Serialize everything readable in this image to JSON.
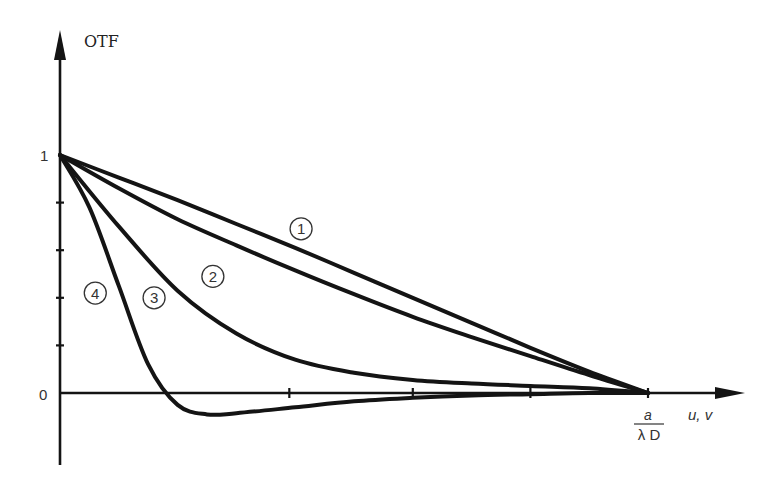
{
  "chart_data": {
    "type": "line",
    "title": "",
    "ylabel": "OTF",
    "xlabel": "u, v",
    "x_end_label": {
      "numerator": "a",
      "denominator": "λ D"
    },
    "xlim": [
      0,
      1.15
    ],
    "ylim": [
      -0.3,
      1.55
    ],
    "ytick_labels": [
      {
        "value": 1,
        "label": "1"
      },
      {
        "value": 0,
        "label": "0"
      }
    ],
    "yticks_minor": [
      0.2,
      0.4,
      0.6,
      0.8
    ],
    "xticks": [
      0.39,
      0.6,
      0.8,
      1.0
    ],
    "x_unit": "a/(λD)",
    "grid": false,
    "legend": "inline circled numbers",
    "series": [
      {
        "name": "1",
        "label": "①",
        "x": [
          0,
          0.1,
          0.2,
          0.3,
          0.4,
          0.5,
          0.6,
          0.7,
          0.8,
          0.9,
          1.0
        ],
        "y": [
          1,
          0.905,
          0.81,
          0.71,
          0.61,
          0.505,
          0.4,
          0.295,
          0.19,
          0.09,
          0
        ]
      },
      {
        "name": "2",
        "label": "②",
        "x": [
          0,
          0.1,
          0.2,
          0.3,
          0.4,
          0.5,
          0.6,
          0.7,
          0.8,
          0.9,
          1.0
        ],
        "y": [
          1,
          0.86,
          0.73,
          0.62,
          0.515,
          0.415,
          0.32,
          0.235,
          0.155,
          0.075,
          0
        ]
      },
      {
        "name": "3",
        "label": "③",
        "x": [
          0,
          0.1,
          0.2,
          0.3,
          0.4,
          0.5,
          0.6,
          0.7,
          0.8,
          0.9,
          1.0
        ],
        "y": [
          1,
          0.7,
          0.43,
          0.25,
          0.14,
          0.085,
          0.055,
          0.04,
          0.03,
          0.02,
          0
        ]
      },
      {
        "name": "4",
        "label": "④",
        "x": [
          0,
          0.05,
          0.1,
          0.15,
          0.2,
          0.25,
          0.3,
          0.4,
          0.5,
          0.6,
          0.7,
          0.8,
          0.9,
          1.0
        ],
        "y": [
          1,
          0.78,
          0.45,
          0.12,
          -0.05,
          -0.09,
          -0.085,
          -0.06,
          -0.035,
          -0.02,
          -0.01,
          -0.005,
          0,
          0
        ]
      }
    ],
    "annotations": [
      {
        "text": "①",
        "series": "1",
        "x": 0.41,
        "y": 0.69
      },
      {
        "text": "②",
        "series": "2",
        "x": 0.26,
        "y": 0.49
      },
      {
        "text": "③",
        "series": "3",
        "x": 0.16,
        "y": 0.4
      },
      {
        "text": "④",
        "series": "4",
        "x": 0.06,
        "y": 0.42
      }
    ]
  }
}
